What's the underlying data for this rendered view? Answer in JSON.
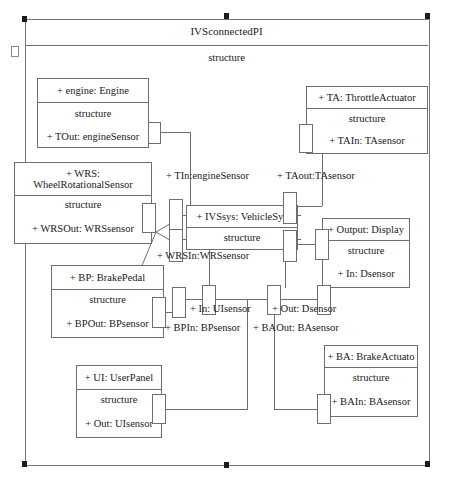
{
  "diagram": {
    "frame_title": "IVSconnectedPI",
    "frame_compartment": "structure",
    "compartment_label": "structure"
  },
  "parts": [
    {
      "id": "engine",
      "name": "+ engine: Engine",
      "compartment": "structure",
      "feature": "+ TOut: engineSensor"
    },
    {
      "id": "wrs",
      "name": "+ WRS:\nWheelRotationalSensor",
      "compartment": "structure",
      "feature": "+ WRSOut: WRSsensor"
    },
    {
      "id": "bp",
      "name": "+ BP: BrakePedal",
      "compartment": "structure",
      "feature": "+ BPOut: BPsensor"
    },
    {
      "id": "ui",
      "name": "+ UI: UserPanel",
      "compartment": "structure",
      "feature": "+ Out: UIsensor"
    },
    {
      "id": "ivssys",
      "name": "+ IVSsys: VehicleSys",
      "compartment": "structure",
      "feature": ""
    },
    {
      "id": "ta",
      "name": "+ TA: ThrottleActuator",
      "compartment": "structure",
      "feature": "+ TAIn: TAsensor"
    },
    {
      "id": "display",
      "name": "+ Output: Display",
      "compartment": "structure",
      "feature": "+ In: Dsensor"
    },
    {
      "id": "ba",
      "name": "+ BA: BrakeActuato",
      "compartment": "structure",
      "feature": "+ BAIn: BAsensor"
    }
  ],
  "port_labels": {
    "tin_engine": "+ TIn:engineSensor",
    "taout_ta": "+ TAout:TAsensor",
    "wrsin_wrs": "+ WRSIn:WRSsensor",
    "in_ui": "+ In: UIsensor",
    "out_d": "+ Out: Dsensor",
    "bpin_bp": "+ BPIn: BPsensor",
    "baout_ba": "+ BAOut: BAsensor"
  },
  "colors": {
    "line": "#6e6e6e",
    "handle": "#1b1b1b",
    "background": "#ffffff",
    "text": "#1a1a1a"
  }
}
